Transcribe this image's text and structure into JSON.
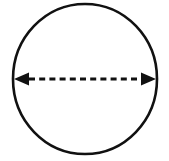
{
  "figure": {
    "background_color": "#ffffff",
    "stroke_color": "#111111",
    "width": 169,
    "height": 161
  },
  "circle": {
    "label": "circle-outline",
    "center_x": 85,
    "center_y": 79,
    "radius_x": 72,
    "radius_y": 75,
    "stroke_width": 2.6,
    "fill": "none",
    "stroke_color": "#111111"
  },
  "diameter": {
    "label": "diameter-double-arrow",
    "start_x": 14,
    "end_x": 156,
    "y": 79,
    "line_width": 3,
    "dash_on": 6,
    "dash_off": 4.2,
    "stroke_color": "#111111",
    "arrowhead": {
      "label": "arrowhead",
      "length": 15,
      "half_height": 6.5,
      "fill": "#111111"
    }
  },
  "annotations": {
    "labels": []
  }
}
